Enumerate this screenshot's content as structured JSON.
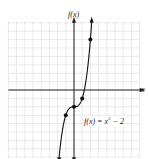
{
  "chart_data": {
    "type": "line",
    "title": "",
    "function": "f(x) = x^3 - 2",
    "xlabel": "x",
    "ylabel": "f(x)",
    "xlim": [
      -8,
      8
    ],
    "ylim": [
      -8,
      8
    ],
    "grid": true,
    "grid_step": 1,
    "points": [
      {
        "x": -1,
        "y": -3
      },
      {
        "x": 0,
        "y": -2
      },
      {
        "x": 1,
        "y": -1
      },
      {
        "x": 2,
        "y": 6
      }
    ],
    "annotation": "f(x) = x³ − 2"
  },
  "labels": {
    "y_axis": "f(x)",
    "x_axis": "x",
    "equation_prefix": "f(x) = x",
    "equation_exp": "3",
    "equation_suffix": " − 2"
  }
}
